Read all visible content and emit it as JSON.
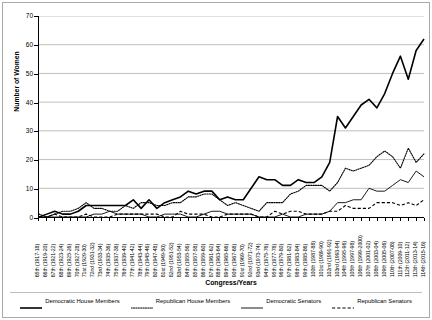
{
  "chart_data": {
    "type": "line",
    "title": "",
    "xlabel": "Congress/Years",
    "ylabel": "Number of Women",
    "ylim": [
      0,
      70
    ],
    "ytick_step": 10,
    "yticks": [
      0,
      10,
      20,
      30,
      40,
      50,
      60,
      70
    ],
    "grid": "horizontal",
    "legend_position": "bottom",
    "categories": [
      "65th (1917-18)",
      "66th (1919-20)",
      "67th (1921-22)",
      "68th (1923-24)",
      "69th (1925-26)",
      "70th (1927-28)",
      "71st (1929-30)",
      "72nd (1931-32)",
      "73rd (1933-34)",
      "74th (1935-36)",
      "75th (1937-38)",
      "76th (1939-40)",
      "77th (1941-42)",
      "78th (1943-44)",
      "79th (1945-46)",
      "80th (1947-48)",
      "81st (1949-50)",
      "82nd (1951-52)",
      "83rd (1953-54)",
      "84th (1955-56)",
      "85th (1957-58)",
      "86th (1959-60)",
      "87th (1961-62)",
      "88th (1963-64)",
      "89th (1965-66)",
      "90th (1967-68)",
      "91st (1969-70)",
      "92nd (1971-72)",
      "93rd (1973-74)",
      "94th (1975-76)",
      "95th (1977-78)",
      "96th (1979-80)",
      "97th (1981-82)",
      "98th (1983-84)",
      "99th (1985-86)",
      "100th (1987-88)",
      "101st (1989-90)",
      "102nd (1991-92)",
      "103rd (1993-94)",
      "104th (1995-96)",
      "105th (1997-98)",
      "106th (1999-2000)",
      "107th (2001-02)",
      "108th (2003-04)",
      "109th (2005-06)",
      "110th (2007-08)",
      "111th (2009-10)",
      "112th (2011-12)",
      "113th (2013-14)",
      "114th (2015-16)"
    ],
    "series": [
      {
        "name": "Democratic House Members",
        "style": "solid-thick",
        "values": [
          0,
          1,
          2,
          1,
          1,
          2,
          4,
          4,
          4,
          4,
          4,
          4,
          6,
          3,
          6,
          3,
          5,
          6,
          7,
          9,
          8,
          9,
          9,
          6,
          7,
          6,
          6,
          10,
          14,
          13,
          13,
          11,
          11,
          13,
          12,
          12,
          14,
          19,
          35,
          31,
          35,
          39,
          41,
          38,
          43,
          50,
          56,
          48,
          58,
          62
        ]
      },
      {
        "name": "Republican House Members",
        "style": "dotted",
        "values": [
          1,
          0,
          1,
          2,
          2,
          3,
          5,
          3,
          3,
          2,
          2,
          4,
          3,
          5,
          5,
          4,
          4,
          5,
          5,
          7,
          7,
          8,
          8,
          6,
          4,
          5,
          4,
          3,
          2,
          5,
          5,
          5,
          8,
          9,
          11,
          11,
          11,
          9,
          12,
          17,
          16,
          17,
          18,
          21,
          23,
          21,
          17,
          24,
          19,
          22
        ]
      },
      {
        "name": "Democratic Senators",
        "style": "solid-thin",
        "values": [
          0,
          0,
          0,
          0,
          0,
          0,
          0,
          1,
          1,
          2,
          1,
          1,
          1,
          1,
          0,
          0,
          1,
          1,
          1,
          0,
          0,
          1,
          2,
          2,
          1,
          1,
          1,
          1,
          0,
          0,
          0,
          1,
          0,
          0,
          1,
          1,
          1,
          2,
          5,
          5,
          6,
          6,
          10,
          9,
          9,
          11,
          13,
          12,
          16,
          14
        ]
      },
      {
        "name": "Republican Senators",
        "style": "dashed",
        "values": [
          0,
          0,
          1,
          0,
          0,
          0,
          1,
          0,
          0,
          0,
          1,
          1,
          1,
          1,
          1,
          1,
          0,
          0,
          2,
          1,
          1,
          1,
          0,
          0,
          1,
          1,
          1,
          1,
          0,
          0,
          2,
          1,
          2,
          2,
          1,
          1,
          1,
          2,
          2,
          4,
          3,
          3,
          3,
          5,
          5,
          5,
          4,
          5,
          4,
          6
        ]
      }
    ]
  },
  "axis": {
    "y_title": "Number of Women",
    "x_title": "Congress/Years"
  },
  "legend": {
    "entries": [
      {
        "label": "Democratic House Members",
        "swatch": "solid-thick-line-swatch"
      },
      {
        "label": "Republican House Members",
        "swatch": "dotted-line-swatch"
      },
      {
        "label": "Democratic Senators",
        "swatch": "solid-thin-line-swatch"
      },
      {
        "label": "Republican Senators",
        "swatch": "dashed-line-swatch"
      }
    ]
  },
  "colors": {
    "series_line": "#000000",
    "gridline": "#b0b0b0",
    "axis": "#000000",
    "background": "#ffffff",
    "figure_border": "#a8a8a8"
  }
}
